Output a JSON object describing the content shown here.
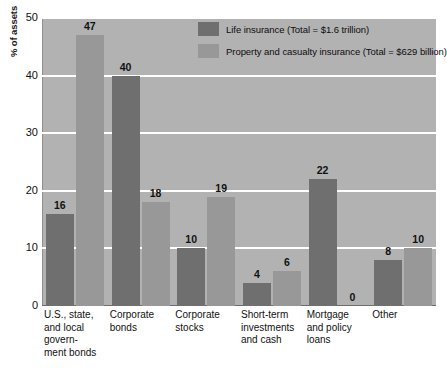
{
  "chart_data": {
    "type": "bar",
    "title": "",
    "subtitle": "",
    "xlabel": "",
    "ylabel": "% of assets",
    "ylim": [
      0,
      50
    ],
    "yticks": [
      0,
      10,
      20,
      30,
      40,
      50
    ],
    "grid": true,
    "legend_position": "top-right-inside",
    "categories": [
      "U.S., state, and local govern-­ment bonds",
      "Corporate bonds",
      "Corporate stocks",
      "Short-term investments and cash",
      "Mortgage and policy loans",
      "Other"
    ],
    "category_lines": [
      [
        "U.S., state,",
        "and local",
        "govern-",
        "ment bonds"
      ],
      [
        "Corporate",
        "bonds"
      ],
      [
        "Corporate",
        "stocks"
      ],
      [
        "Short-term",
        "investments",
        "and cash"
      ],
      [
        "Mortgage",
        "and policy",
        "loans"
      ],
      [
        "Other"
      ]
    ],
    "series": [
      {
        "name": "Life insurance (Total = $1.6 trillion)",
        "color": "#6f6f6f",
        "values": [
          16,
          40,
          10,
          4,
          22,
          8
        ]
      },
      {
        "name": "Property and casualty insurance (Total = $629 billion)",
        "color": "#989898",
        "values": [
          47,
          18,
          19,
          6,
          0,
          10
        ]
      }
    ]
  },
  "axis": {
    "y_title": "% of assets",
    "y_ticks": [
      "0",
      "10",
      "20",
      "30",
      "40",
      "50"
    ]
  },
  "legend": {
    "items": [
      {
        "label": "Life insurance (Total = $1.6 trillion)",
        "swatch": "dark"
      },
      {
        "label": "Property and casualty insurance (Total = $629 billion)",
        "swatch": "light"
      }
    ]
  },
  "colors": {
    "plot_background": "#b2b2b2",
    "gridline": "#ffffff",
    "series_life": "#6f6f6f",
    "series_property": "#989898",
    "text": "#111111",
    "page_background": "#ffffff"
  }
}
